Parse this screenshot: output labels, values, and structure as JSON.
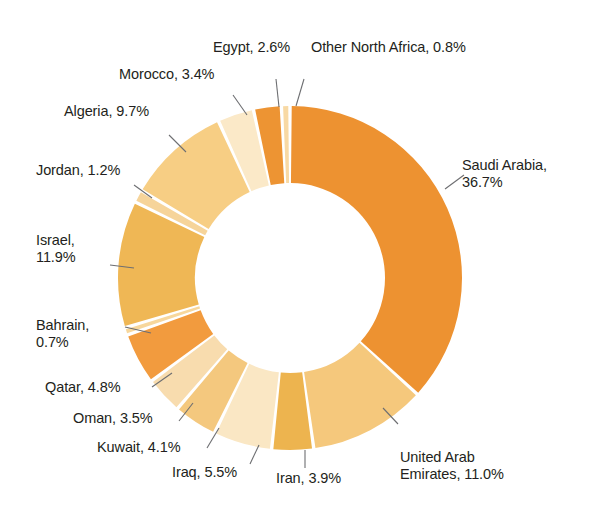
{
  "chart_data": {
    "type": "pie",
    "variant": "donut",
    "title": "",
    "subtitle": "",
    "xlabel": "",
    "ylabel": "",
    "legend_position": "none",
    "grid": false,
    "label_format": "{name}, {value}%",
    "start_angle_deg": 0,
    "direction": "clockwise",
    "categories": [
      "Saudi Arabia",
      "United Arab Emirates",
      "Iran",
      "Iraq",
      "Kuwait",
      "Oman",
      "Qatar",
      "Bahrain",
      "Israel",
      "Jordan",
      "Algeria",
      "Morocco",
      "Egypt",
      "Other North Africa"
    ],
    "values": [
      36.7,
      11.0,
      3.9,
      5.5,
      4.1,
      3.5,
      4.8,
      0.7,
      11.9,
      1.2,
      9.7,
      3.4,
      2.6,
      0.8
    ],
    "colors": [
      "#ED9231",
      "#F5C87C",
      "#EDB44F",
      "#FAE7C4",
      "#F4C87E",
      "#F8DCAE",
      "#F29B3E",
      "#F7D79C",
      "#EFB755",
      "#F6D49A",
      "#F7CE84",
      "#FBE9C8",
      "#ED9433",
      "#F8D9A4"
    ],
    "slice_gap_color": "#ffffff",
    "ylim": [
      0,
      100
    ]
  },
  "labels": {
    "saudi_arabia": "Saudi Arabia,\n36.7%",
    "united_arab_emirates": "United Arab\nEmirates, 11.0%",
    "iran": "Iran, 3.9%",
    "iraq": "Iraq, 5.5%",
    "kuwait": "Kuwait, 4.1%",
    "oman": "Oman, 3.5%",
    "qatar": "Qatar, 4.8%",
    "bahrain": "Bahrain,\n0.7%",
    "israel": "Israel,\n11.9%",
    "jordan": "Jordan, 1.2%",
    "algeria": "Algeria, 9.7%",
    "morocco": "Morocco, 3.4%",
    "egypt": "Egypt, 2.6%",
    "other_north_africa": "Other North Africa, 0.8%"
  }
}
